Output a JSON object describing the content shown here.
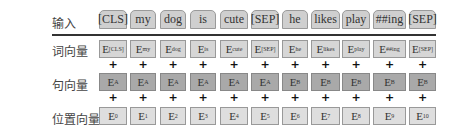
{
  "rows": {
    "input": {
      "label": "输入"
    },
    "token_emb": {
      "label": "词向量"
    },
    "segment_emb": {
      "label": "句向量"
    },
    "position_emb": {
      "label": "位置向量"
    }
  },
  "tokens": [
    "[CLS]",
    "my",
    "dog",
    "is",
    "cute",
    "[SEP]",
    "he",
    "likes",
    "play",
    "##ing",
    "[SEP]"
  ],
  "token_embeddings": [
    {
      "base": "E",
      "sub": "[CLS]"
    },
    {
      "base": "E",
      "sub": "my"
    },
    {
      "base": "E",
      "sub": "dog"
    },
    {
      "base": "E",
      "sub": "is"
    },
    {
      "base": "E",
      "sub": "cute"
    },
    {
      "base": "E",
      "sub": "[SEP]"
    },
    {
      "base": "E",
      "sub": "he"
    },
    {
      "base": "E",
      "sub": "likes"
    },
    {
      "base": "E",
      "sub": "play"
    },
    {
      "base": "E",
      "sub": "##ing"
    },
    {
      "base": "E",
      "sub": "[SEP]"
    }
  ],
  "segment_embeddings": [
    {
      "base": "E",
      "sub": "A"
    },
    {
      "base": "E",
      "sub": "A"
    },
    {
      "base": "E",
      "sub": "A"
    },
    {
      "base": "E",
      "sub": "A"
    },
    {
      "base": "E",
      "sub": "A"
    },
    {
      "base": "E",
      "sub": "A"
    },
    {
      "base": "E",
      "sub": "B"
    },
    {
      "base": "E",
      "sub": "B"
    },
    {
      "base": "E",
      "sub": "B"
    },
    {
      "base": "E",
      "sub": "B"
    },
    {
      "base": "E",
      "sub": "B"
    }
  ],
  "position_embeddings": [
    {
      "base": "E",
      "sub": "0"
    },
    {
      "base": "E",
      "sub": "1"
    },
    {
      "base": "E",
      "sub": "2"
    },
    {
      "base": "E",
      "sub": "3"
    },
    {
      "base": "E",
      "sub": "4"
    },
    {
      "base": "E",
      "sub": "5"
    },
    {
      "base": "E",
      "sub": "6"
    },
    {
      "base": "E",
      "sub": "7"
    },
    {
      "base": "E",
      "sub": "8"
    },
    {
      "base": "E",
      "sub": "9"
    },
    {
      "base": "E",
      "sub": "10"
    }
  ],
  "operator": "+",
  "colors": {
    "token": "#cfcfcf",
    "segment": "#a9a9a9",
    "position": "#dedede",
    "divider": "#333333"
  }
}
